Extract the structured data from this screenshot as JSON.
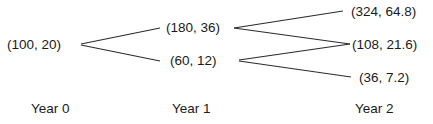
{
  "diagram": {
    "type": "binomial-tree",
    "nodes": {
      "y0": "(100, 20)",
      "y1_up": "(180, 36)",
      "y1_down": "(60, 12)",
      "y2_uu": "(324, 64.8)",
      "y2_ud": "(108, 21.6)",
      "y2_dd": "(36, 7.2)"
    },
    "labels": {
      "year0": "Year 0",
      "year1": "Year 1",
      "year2": "Year 2"
    },
    "edges": [
      [
        "y0",
        "y1_up"
      ],
      [
        "y0",
        "y1_down"
      ],
      [
        "y1_up",
        "y2_uu"
      ],
      [
        "y1_up",
        "y2_ud"
      ],
      [
        "y1_down",
        "y2_ud"
      ],
      [
        "y1_down",
        "y2_dd"
      ]
    ]
  }
}
